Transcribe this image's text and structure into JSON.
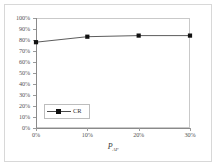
{
  "chart_data": {
    "type": "line",
    "title": "",
    "xlabel": "P_AF",
    "xlabel_main": "P",
    "xlabel_sub": "AF",
    "ylabel": "",
    "x": [
      0,
      10,
      20,
      30
    ],
    "x_tick_labels": [
      "0%",
      "10%",
      "20%",
      "30%"
    ],
    "y_tick_labels": [
      "100%",
      "90%",
      "80%",
      "70%",
      "60%",
      "50%",
      "40%",
      "30%",
      "20%",
      "10%",
      "0%"
    ],
    "y_ticks": [
      100,
      90,
      80,
      70,
      60,
      50,
      40,
      30,
      20,
      10,
      0
    ],
    "xlim": [
      0,
      30
    ],
    "ylim": [
      0,
      100
    ],
    "grid": false,
    "legend_position": "lower-left-inside",
    "series": [
      {
        "name": "CR",
        "values": [
          78,
          83,
          84,
          84
        ],
        "marker": "square",
        "line_color": "#4a4a4a",
        "marker_color": "#111111"
      }
    ]
  },
  "legend": {
    "entries": [
      {
        "label": "CR"
      }
    ]
  },
  "axes": {
    "x_title_main": "P",
    "x_title_sub": "AF"
  },
  "colors": {
    "frame": "#d8d8d8",
    "plot_border": "#c9c9c9",
    "axis": "#8a8a8a",
    "tick_text": "#555555",
    "series_line": "#4a4a4a",
    "series_marker": "#111111"
  }
}
